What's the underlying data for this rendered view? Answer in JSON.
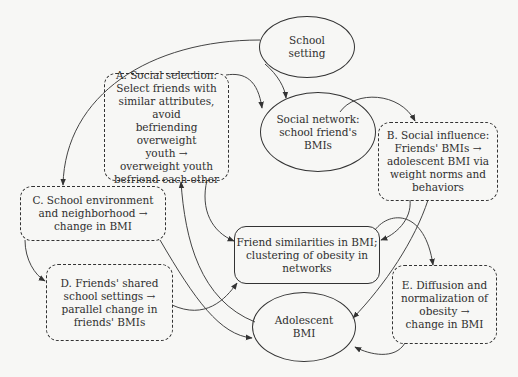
{
  "diagram": {
    "type": "conceptual-flow",
    "nodes": {
      "school_setting": {
        "label": "School\nsetting",
        "shape": "ellipse"
      },
      "social_selection": {
        "label": "A. Social selection:\nSelect friends with\nsimilar attributes, avoid\nbefriending overweight\nyouth →\noverweight youth\nbefriend each other",
        "shape": "dashed-rounded-rect"
      },
      "social_network": {
        "label": "Social network:\nschool friend's\nBMIs",
        "shape": "ellipse"
      },
      "social_influence": {
        "label": "B. Social influence:\nFriends' BMIs →\nadolescent BMI via\nweight norms and\nbehaviors",
        "shape": "dashed-rounded-rect"
      },
      "school_environment": {
        "label": "C. School environment\nand neighborhood →\nchange in BMI",
        "shape": "dashed-rounded-rect"
      },
      "friend_similarities": {
        "label": "Friend similarities in BMI;\nclustering of obesity in\nnetworks",
        "shape": "solid-rounded-rect"
      },
      "shared_settings": {
        "label": "D. Friends' shared\nschool settings →\nparallel change in\nfriends' BMIs",
        "shape": "dashed-rounded-rect"
      },
      "diffusion": {
        "label": "E. Diffusion and\nnormalization of\nobesity →\nchange in BMI",
        "shape": "dashed-rounded-rect"
      },
      "adolescent_bmi": {
        "label": "Adolescent\nBMI",
        "shape": "ellipse"
      }
    },
    "edges": [
      {
        "from": "school_setting",
        "to": "school_environment"
      },
      {
        "from": "school_setting",
        "to": "social_network"
      },
      {
        "from": "social_selection",
        "to": "social_network"
      },
      {
        "from": "social_network",
        "to": "social_influence"
      },
      {
        "from": "social_selection",
        "to": "friend_similarities"
      },
      {
        "from": "adolescent_bmi",
        "to": "social_selection"
      },
      {
        "from": "social_influence",
        "to": "friend_similarities"
      },
      {
        "from": "social_influence",
        "to": "adolescent_bmi"
      },
      {
        "from": "school_environment",
        "to": "shared_settings"
      },
      {
        "from": "school_environment",
        "to": "adolescent_bmi"
      },
      {
        "from": "shared_settings",
        "to": "friend_similarities"
      },
      {
        "from": "friend_similarities",
        "to": "diffusion"
      },
      {
        "from": "diffusion",
        "to": "adolescent_bmi"
      }
    ],
    "colors": {
      "stroke": "#333333",
      "background": "#f7f7f5"
    }
  },
  "background_text": "show-through text from reverse page (illegible)"
}
